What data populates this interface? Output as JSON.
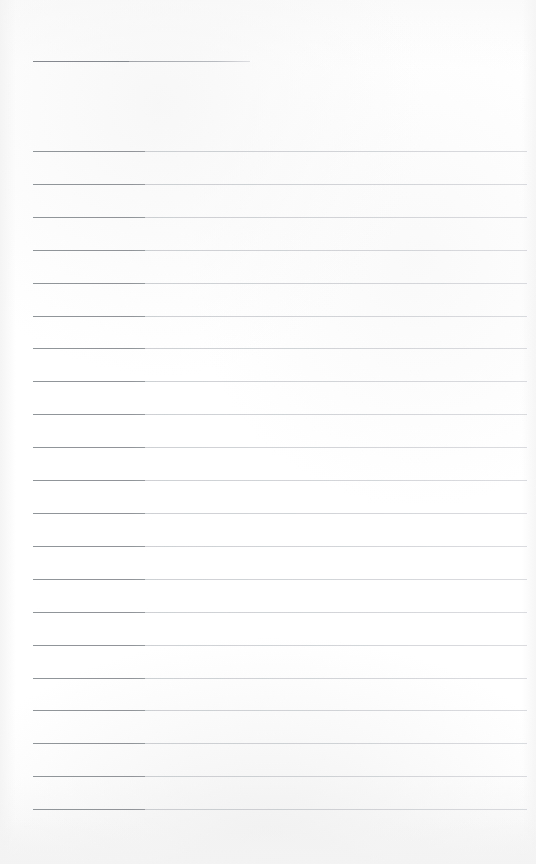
{
  "page": {
    "kind": "blank-ruled-writing-page",
    "width": 536,
    "height": 864,
    "background_color": "#fdfdfd",
    "paper_tint_color": "#f6f6f7",
    "bottom_shade_color": "#f3f3f4",
    "content_text": ""
  },
  "title_rule": {
    "label": "title-rule",
    "x_start": 33,
    "x_end": 250,
    "y": 61,
    "thickness": 1,
    "color": "#8a8e94",
    "value": ""
  },
  "rules": {
    "label": "ruled-lines",
    "count": 21,
    "x_start": 33,
    "x_end": 527,
    "first_y": 151,
    "spacing": 32.9,
    "thickness": 1,
    "color": "#b0b4b9",
    "lead_segment_color": "#8e9297",
    "lead_segment_width": 112,
    "y_positions": [
      151,
      184,
      217,
      250,
      283,
      316,
      348,
      381,
      414,
      447,
      480,
      513,
      546,
      579,
      612,
      645,
      678,
      710,
      743,
      776,
      809
    ],
    "line_values": [
      "",
      "",
      "",
      "",
      "",
      "",
      "",
      "",
      "",
      "",
      "",
      "",
      "",
      "",
      "",
      "",
      "",
      "",
      "",
      "",
      ""
    ]
  }
}
